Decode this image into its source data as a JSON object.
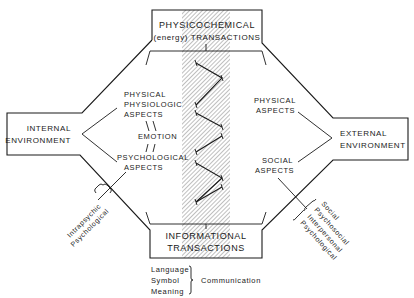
{
  "diagram": {
    "top_box": {
      "line1": "PHYSICOCHEMICAL",
      "line2": "(energy) TRANSACTIONS"
    },
    "bottom_box": {
      "line1": "INFORMATIONAL",
      "line2": "TRANSACTIONS"
    },
    "left_box": {
      "line1": "INTERNAL",
      "line2": "ENVIRONMENT"
    },
    "right_box": {
      "line1": "EXTERNAL",
      "line2": "ENVIRONMENT"
    },
    "internal_aspects": {
      "physical": [
        "PHYSICAL",
        "PHYSIOLOGIC",
        "ASPECTS"
      ],
      "emotion": "EMOTION",
      "psychological": [
        "PSYCHOLOGICAL",
        "ASPECTS"
      ]
    },
    "external_aspects": {
      "physical": [
        "PHYSICAL",
        "ASPECTS"
      ],
      "social": [
        "SOCIAL",
        "ASPECTS"
      ]
    },
    "left_bracket_terms": [
      "Intrapsychic",
      "Psychological"
    ],
    "right_bracket_terms": [
      "Social",
      "Psychosocial",
      "Interpersonal",
      "Psychological"
    ],
    "communication": {
      "items": [
        "Language",
        "Symbol",
        "Meaning"
      ],
      "label": "Communication"
    },
    "colors": {
      "ink": "#1a1a1a",
      "background": "#ffffff",
      "hatch": "#8a8a8a"
    }
  }
}
